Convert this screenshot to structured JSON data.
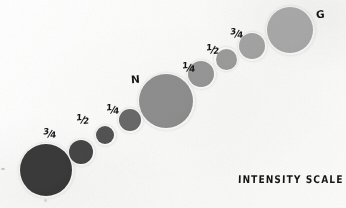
{
  "sheet": {
    "title": "INTENSITY SCALE",
    "width": 346,
    "height": 208,
    "background_color": "#fdfdfc",
    "ink_color": "#141414"
  },
  "chart_data": {
    "type": "scatter",
    "title": "INTENSITY SCALE",
    "xlabel": "",
    "ylabel": "",
    "grid": false,
    "legend": null,
    "categories": [
      "",
      "3/4",
      "1/2",
      "1/4",
      "N",
      "1/4",
      "1/2",
      "3/4",
      "G"
    ],
    "values": [
      58,
      70,
      83,
      105,
      142,
      150,
      155,
      163,
      168
    ],
    "series": [
      {
        "name": "gray_level_0_255",
        "values": [
          58,
          70,
          83,
          105,
          142,
          150,
          155,
          163,
          168
        ]
      },
      {
        "name": "patch_diameter_px",
        "values": [
          52,
          24,
          18,
          22,
          54,
          26,
          21,
          26,
          46
        ]
      }
    ],
    "points": [
      {
        "index": 0,
        "label": "",
        "label_kind": "none",
        "cx": 46,
        "cy": 170,
        "d": 52,
        "gray": "#3a3a3a",
        "gray_level": 58
      },
      {
        "index": 1,
        "label": "3/4",
        "label_kind": "fraction",
        "numerator": "3",
        "denominator": "4",
        "cx": 81,
        "cy": 152,
        "d": 24,
        "gray": "#464646",
        "gray_level": 70,
        "label_x": 43,
        "label_y": 124
      },
      {
        "index": 2,
        "label": "1/2",
        "label_kind": "fraction",
        "numerator": "1",
        "denominator": "2",
        "cx": 105,
        "cy": 135,
        "d": 18,
        "gray": "#535353",
        "gray_level": 83,
        "label_x": 76,
        "label_y": 110
      },
      {
        "index": 3,
        "label": "1/4",
        "label_kind": "fraction",
        "numerator": "1",
        "denominator": "4",
        "cx": 130,
        "cy": 120,
        "d": 22,
        "gray": "#696969",
        "gray_level": 105,
        "label_x": 106,
        "label_y": 100
      },
      {
        "index": 4,
        "label": "N",
        "label_kind": "letter",
        "cx": 166,
        "cy": 101,
        "d": 54,
        "gray": "#8e8e8e",
        "gray_level": 142,
        "label_x": 131,
        "label_y": 70
      },
      {
        "index": 5,
        "label": "1/4",
        "label_kind": "fraction",
        "numerator": "1",
        "denominator": "4",
        "cx": 201,
        "cy": 74,
        "d": 26,
        "gray": "#969696",
        "gray_level": 150,
        "label_x": 182,
        "label_y": 58
      },
      {
        "index": 6,
        "label": "1/2",
        "label_kind": "fraction",
        "numerator": "1",
        "denominator": "2",
        "cx": 226,
        "cy": 59,
        "d": 21,
        "gray": "#9b9b9b",
        "gray_level": 155,
        "label_x": 206,
        "label_y": 40
      },
      {
        "index": 7,
        "label": "3/4",
        "label_kind": "fraction",
        "numerator": "3",
        "denominator": "4",
        "cx": 252,
        "cy": 46,
        "d": 26,
        "gray": "#a3a3a3",
        "gray_level": 163,
        "label_x": 230,
        "label_y": 24
      },
      {
        "index": 8,
        "label": "G",
        "label_kind": "letter",
        "cx": 290,
        "cy": 30,
        "d": 46,
        "gray": "#a8a8a8",
        "gray_level": 168,
        "label_x": 316,
        "label_y": 5
      }
    ]
  }
}
